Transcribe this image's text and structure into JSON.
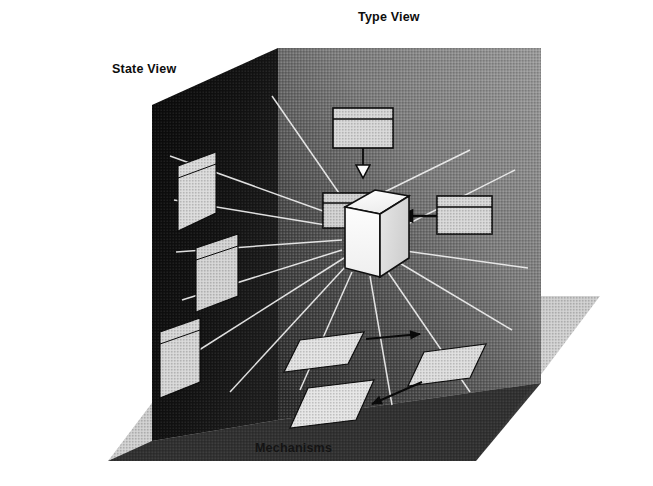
{
  "figure": {
    "kind": "3d-perspective-diagram",
    "background_color": "#ffffff"
  },
  "labels": {
    "type_view": "Type View",
    "state_view": "State View",
    "mechanisms": "Mechanisms"
  },
  "planes": [
    {
      "name": "type-view-wall",
      "label": "Type View",
      "orientation": "back-vertical",
      "fill": "#808080",
      "note": "mid-gray halftone back wall, darkens toward lower-left"
    },
    {
      "name": "state-view-wall",
      "label": "State View",
      "orientation": "left-vertical",
      "fill": "#0e0e0e",
      "note": "near-black left wall in shadow"
    },
    {
      "name": "mechanisms-floor",
      "label": "Mechanisms",
      "orientation": "horizontal-ground",
      "fill": "#c8c8c8",
      "note": "light gray halftone ground plane extending to lower right"
    }
  ],
  "center": {
    "name": "object-cube",
    "shape": "cube",
    "fill": "#fbfbfb",
    "stroke": "#101010",
    "note": "white 3D cube at the convergence point of all three views"
  },
  "type_view_boxes": [
    {
      "name": "supertype-box",
      "position": "above-cube",
      "fill": "#d6d6d6",
      "compartments": 2
    },
    {
      "name": "left-type-box",
      "position": "left-of-cube",
      "fill": "#d0d0d0",
      "compartments": 2
    },
    {
      "name": "right-type-box",
      "position": "right-of-cube",
      "fill": "#d6d6d6",
      "compartments": 2
    }
  ],
  "type_view_connectors": [
    {
      "name": "generalization-connector",
      "from": "supertype-box",
      "to": "object-cube",
      "arrow": "hollow-triangle",
      "direction": "down"
    },
    {
      "name": "association-connector",
      "from": "right-type-box",
      "to": "object-cube",
      "arrow": "solid-arrowhead",
      "direction": "left"
    }
  ],
  "state_panels": [
    {
      "name": "state-panel-1",
      "fill": "#d9d9d9"
    },
    {
      "name": "state-panel-2",
      "fill": "#d2d2d2"
    },
    {
      "name": "state-panel-3",
      "fill": "#d5d5d5"
    }
  ],
  "mechanism_tiles": [
    {
      "name": "mechanism-tile-1",
      "fill": "#e2e2e2"
    },
    {
      "name": "mechanism-tile-2",
      "fill": "#dcdcdc"
    },
    {
      "name": "mechanism-tile-3",
      "fill": "#e4e4e4"
    }
  ],
  "mechanism_connectors": [
    {
      "name": "mechanism-arrow-1",
      "arrow": "solid-arrowhead",
      "direction": "right"
    },
    {
      "name": "mechanism-arrow-2",
      "arrow": "solid-arrowhead",
      "direction": "down-right"
    }
  ],
  "rays": {
    "name": "projection-rays",
    "count": 14,
    "color": "#f2f2f2",
    "note": "thin light rays radiating outward from the central cube to every view plane"
  },
  "colors": {
    "paper": "#ffffff",
    "ink": "#0d0d0d",
    "back_wall": "#808080",
    "left_wall": "#0e0e0e",
    "floor": "#c8c8c8",
    "cube": "#fbfbfb",
    "ray": "#f2f2f2"
  }
}
